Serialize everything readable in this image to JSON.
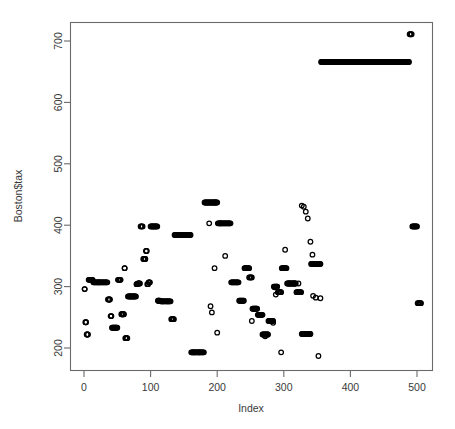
{
  "chart_data": {
    "type": "scatter",
    "title": "",
    "xlabel": "Index",
    "ylabel": "Boston$tax",
    "xlim": [
      -9,
      515
    ],
    "ylim": [
      178,
      733
    ],
    "xticks": [
      0,
      100,
      200,
      300,
      400,
      500
    ],
    "yticks": [
      200,
      300,
      400,
      500,
      600,
      700
    ],
    "xtick_labels": [
      "0",
      "100",
      "200",
      "300",
      "400",
      "500"
    ],
    "ytick_labels": [
      "200",
      "300",
      "400",
      "500",
      "600",
      "700"
    ],
    "grid": false,
    "legend": false,
    "point_symbol": "open-circle",
    "point_color": "#000000",
    "n_points": 506,
    "series": [
      {
        "name": "Boston$tax",
        "x_start": 1,
        "x_step": 1,
        "values": [
          296,
          242,
          242,
          222,
          222,
          222,
          311,
          311,
          311,
          311,
          311,
          311,
          311,
          307,
          307,
          307,
          307,
          307,
          307,
          307,
          307,
          307,
          307,
          307,
          307,
          307,
          307,
          307,
          307,
          307,
          307,
          307,
          307,
          307,
          307,
          279,
          279,
          279,
          279,
          252,
          252,
          233,
          233,
          233,
          233,
          233,
          233,
          233,
          233,
          233,
          311,
          311,
          311,
          311,
          311,
          255,
          255,
          255,
          255,
          255,
          330,
          216,
          216,
          216,
          216,
          284,
          284,
          284,
          284,
          284,
          284,
          284,
          284,
          284,
          284,
          284,
          284,
          284,
          304,
          304,
          305,
          305,
          305,
          305,
          398,
          398,
          398,
          398,
          398,
          398,
          398,
          398,
          398,
          398,
          398,
          398,
          398,
          398,
          398,
          398,
          398,
          398,
          398,
          398,
          398,
          398,
          398,
          398,
          398,
          398,
          398,
          398,
          277,
          277,
          277,
          277,
          277,
          277,
          277,
          277,
          277,
          277,
          277,
          277,
          277,
          277,
          276,
          276,
          276,
          276,
          276,
          276,
          276,
          276,
          276,
          276,
          276,
          276,
          276,
          276,
          276,
          276,
          384,
          384,
          384,
          384,
          384,
          384,
          384,
          384,
          384,
          384,
          384,
          384,
          384,
          384,
          384,
          384,
          384,
          384,
          384,
          384,
          384,
          384,
          384,
          384,
          384,
          384,
          384,
          384,
          384,
          384,
          193,
          193,
          193,
          193,
          193,
          193,
          193,
          193,
          193,
          193,
          193,
          193,
          193,
          193,
          193,
          193,
          193,
          193,
          193,
          193,
          193,
          193,
          193,
          437,
          437,
          437,
          437,
          437,
          437,
          437,
          437,
          437,
          437,
          437,
          437,
          437,
          437,
          437,
          437,
          437,
          437,
          437,
          437,
          437,
          437,
          437,
          437,
          437,
          437,
          437,
          437,
          437,
          437,
          398,
          398,
          398,
          398,
          398,
          398,
          398,
          398,
          398,
          398,
          398,
          398,
          398,
          398,
          398,
          398,
          398,
          398,
          398,
          398,
          398,
          398,
          398,
          398,
          398,
          398,
          398,
          398,
          398,
          398,
          398,
          398,
          398,
          398,
          398,
          398,
          398,
          398,
          398,
          398,
          398,
          398,
          398,
          398,
          398,
          398,
          398,
          398,
          398,
          398,
          398,
          398,
          398,
          398,
          398,
          398,
          398,
          398,
          398,
          398,
          296,
          296,
          296,
          296,
          296,
          296,
          296,
          296,
          296,
          296,
          296,
          296,
          296,
          296,
          296,
          296,
          296,
          296,
          296,
          296,
          296,
          193,
          193,
          193,
          193,
          193,
          193,
          193,
          193,
          193,
          193,
          193,
          193,
          193,
          193,
          193,
          193,
          193,
          193,
          193,
          193,
          193,
          193,
          193,
          193,
          193,
          193,
          193,
          193,
          193,
          193,
          193,
          193,
          193,
          193,
          193,
          193,
          193,
          193,
          193,
          193,
          193,
          193,
          193,
          193,
          193,
          193,
          193,
          193,
          193,
          193,
          193,
          193,
          193,
          193,
          193,
          193,
          193,
          193,
          193,
          193,
          193,
          193,
          193,
          193,
          193,
          193,
          193,
          193,
          193,
          193,
          193,
          193,
          193,
          193,
          193,
          193,
          193,
          193,
          193,
          193,
          193,
          193,
          193,
          193,
          193,
          193,
          193,
          193,
          193,
          193,
          193,
          193,
          193,
          193,
          193,
          193,
          193,
          193,
          193,
          193,
          193,
          193,
          193,
          193,
          193,
          193,
          193,
          193,
          193,
          193,
          193,
          193,
          193,
          193,
          193,
          193,
          193,
          193,
          193,
          193,
          193,
          193,
          193,
          193,
          193,
          193,
          193,
          193,
          193,
          193,
          193,
          193,
          193,
          193,
          193,
          193,
          193,
          193,
          193,
          193,
          193,
          193,
          193,
          193,
          193,
          193,
          193,
          193,
          193,
          193,
          193,
          193,
          193,
          193,
          193,
          193,
          193,
          193,
          193,
          193,
          193,
          193,
          193,
          193,
          193,
          193,
          193,
          193,
          193,
          193,
          193,
          193,
          193,
          193,
          193,
          193,
          193,
          193,
          193,
          193,
          193,
          193,
          193,
          193,
          193,
          193,
          193,
          193,
          193,
          193,
          193,
          193,
          193,
          193,
          193,
          193,
          193,
          193,
          193,
          193
        ]
      }
    ],
    "notes": [
      "Long dense horizontal run at tax = 666 spanning index ~356 to ~488",
      "Isolated high points at tax = 711 near index ~489-491",
      "Right edge points at tax = 398 and tax = 273 near index ~500"
    ]
  },
  "axes": {
    "y_title": "Boston$tax",
    "x_title": "Index"
  }
}
